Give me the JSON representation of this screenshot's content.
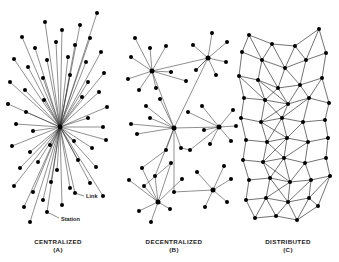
{
  "figure": {
    "background_color": "#ffffff",
    "node_color": "#000000",
    "edge_color": "#333333",
    "width": 339,
    "height": 262
  },
  "annotations": {
    "link_label": "Link",
    "station_label": "Station",
    "link_label_pos": {
      "x": 86,
      "y": 198
    },
    "link_leader": {
      "x1": 84,
      "y1": 196,
      "x2": 75,
      "y2": 193
    },
    "station_label_pos": {
      "x": 61,
      "y": 221
    },
    "station_leader": {
      "x1": 59,
      "y1": 218,
      "x2": 47,
      "y2": 212
    }
  },
  "panels": [
    {
      "id": "centralized",
      "name": "CENTRALIZED",
      "letter": "(A)",
      "caption_x": 58,
      "caption_y": 244,
      "letter_y": 252,
      "type": "star",
      "hub": {
        "x": 60,
        "y": 127
      },
      "nodes": [
        {
          "x": 60,
          "y": 127
        },
        {
          "x": 22,
          "y": 37
        },
        {
          "x": 45,
          "y": 22
        },
        {
          "x": 62,
          "y": 30
        },
        {
          "x": 80,
          "y": 25
        },
        {
          "x": 97,
          "y": 13
        },
        {
          "x": 35,
          "y": 48
        },
        {
          "x": 56,
          "y": 42
        },
        {
          "x": 75,
          "y": 45
        },
        {
          "x": 90,
          "y": 38
        },
        {
          "x": 14,
          "y": 59
        },
        {
          "x": 28,
          "y": 67
        },
        {
          "x": 47,
          "y": 60
        },
        {
          "x": 68,
          "y": 57
        },
        {
          "x": 86,
          "y": 62
        },
        {
          "x": 101,
          "y": 52
        },
        {
          "x": 10,
          "y": 82
        },
        {
          "x": 25,
          "y": 90
        },
        {
          "x": 43,
          "y": 78
        },
        {
          "x": 70,
          "y": 75
        },
        {
          "x": 88,
          "y": 82
        },
        {
          "x": 104,
          "y": 73
        },
        {
          "x": 8,
          "y": 104
        },
        {
          "x": 26,
          "y": 112
        },
        {
          "x": 44,
          "y": 100
        },
        {
          "x": 82,
          "y": 97
        },
        {
          "x": 99,
          "y": 92
        },
        {
          "x": 107,
          "y": 107
        },
        {
          "x": 16,
          "y": 124
        },
        {
          "x": 33,
          "y": 131
        },
        {
          "x": 88,
          "y": 118
        },
        {
          "x": 103,
          "y": 127
        },
        {
          "x": 12,
          "y": 146
        },
        {
          "x": 30,
          "y": 152
        },
        {
          "x": 50,
          "y": 145
        },
        {
          "x": 74,
          "y": 141
        },
        {
          "x": 92,
          "y": 148
        },
        {
          "x": 106,
          "y": 140
        },
        {
          "x": 20,
          "y": 168
        },
        {
          "x": 38,
          "y": 162
        },
        {
          "x": 57,
          "y": 170
        },
        {
          "x": 78,
          "y": 160
        },
        {
          "x": 96,
          "y": 167
        },
        {
          "x": 14,
          "y": 186
        },
        {
          "x": 33,
          "y": 192
        },
        {
          "x": 51,
          "y": 182
        },
        {
          "x": 70,
          "y": 188
        },
        {
          "x": 90,
          "y": 183
        },
        {
          "x": 24,
          "y": 207
        },
        {
          "x": 43,
          "y": 200
        },
        {
          "x": 62,
          "y": 205
        },
        {
          "x": 47,
          "y": 212
        },
        {
          "x": 75,
          "y": 193
        },
        {
          "x": 103,
          "y": 196
        },
        {
          "x": 30,
          "y": 222
        }
      ]
    },
    {
      "id": "decentralized",
      "name": "DECENTRALIZED",
      "letter": "(B)",
      "caption_x": 174,
      "caption_y": 244,
      "letter_y": 252,
      "type": "multi-hub",
      "hubs": [
        {
          "x": 152,
          "y": 71
        },
        {
          "x": 208,
          "y": 58
        },
        {
          "x": 174,
          "y": 128
        },
        {
          "x": 219,
          "y": 127
        },
        {
          "x": 158,
          "y": 202
        },
        {
          "x": 213,
          "y": 190
        }
      ],
      "nodes": [
        {
          "x": 152,
          "y": 71
        },
        {
          "x": 208,
          "y": 58
        },
        {
          "x": 174,
          "y": 128
        },
        {
          "x": 219,
          "y": 127
        },
        {
          "x": 158,
          "y": 202
        },
        {
          "x": 213,
          "y": 190
        },
        {
          "x": 135,
          "y": 38
        },
        {
          "x": 150,
          "y": 48
        },
        {
          "x": 166,
          "y": 46
        },
        {
          "x": 131,
          "y": 57
        },
        {
          "x": 128,
          "y": 79
        },
        {
          "x": 139,
          "y": 90
        },
        {
          "x": 156,
          "y": 88
        },
        {
          "x": 171,
          "y": 72
        },
        {
          "x": 186,
          "y": 81
        },
        {
          "x": 193,
          "y": 45
        },
        {
          "x": 212,
          "y": 33
        },
        {
          "x": 227,
          "y": 42
        },
        {
          "x": 226,
          "y": 62
        },
        {
          "x": 216,
          "y": 75
        },
        {
          "x": 196,
          "y": 70
        },
        {
          "x": 146,
          "y": 106
        },
        {
          "x": 160,
          "y": 99
        },
        {
          "x": 150,
          "y": 118
        },
        {
          "x": 131,
          "y": 124
        },
        {
          "x": 137,
          "y": 134
        },
        {
          "x": 166,
          "y": 150
        },
        {
          "x": 181,
          "y": 148
        },
        {
          "x": 188,
          "y": 112
        },
        {
          "x": 202,
          "y": 106
        },
        {
          "x": 233,
          "y": 110
        },
        {
          "x": 236,
          "y": 126
        },
        {
          "x": 231,
          "y": 141
        },
        {
          "x": 210,
          "y": 144
        },
        {
          "x": 204,
          "y": 130
        },
        {
          "x": 142,
          "y": 168
        },
        {
          "x": 155,
          "y": 176
        },
        {
          "x": 171,
          "y": 163
        },
        {
          "x": 129,
          "y": 180
        },
        {
          "x": 182,
          "y": 179
        },
        {
          "x": 144,
          "y": 186
        },
        {
          "x": 139,
          "y": 211
        },
        {
          "x": 170,
          "y": 209
        },
        {
          "x": 151,
          "y": 222
        },
        {
          "x": 174,
          "y": 192
        },
        {
          "x": 197,
          "y": 172
        },
        {
          "x": 224,
          "y": 166
        },
        {
          "x": 231,
          "y": 179
        },
        {
          "x": 205,
          "y": 207
        },
        {
          "x": 227,
          "y": 202
        },
        {
          "x": 190,
          "y": 150
        }
      ],
      "edges": [
        [
          0,
          6
        ],
        [
          0,
          7
        ],
        [
          0,
          8
        ],
        [
          0,
          9
        ],
        [
          0,
          10
        ],
        [
          0,
          11
        ],
        [
          0,
          12
        ],
        [
          0,
          13
        ],
        [
          0,
          14
        ],
        [
          1,
          15
        ],
        [
          1,
          16
        ],
        [
          1,
          17
        ],
        [
          1,
          18
        ],
        [
          1,
          19
        ],
        [
          1,
          20
        ],
        [
          1,
          0
        ],
        [
          2,
          21
        ],
        [
          2,
          22
        ],
        [
          2,
          23
        ],
        [
          2,
          24
        ],
        [
          2,
          25
        ],
        [
          2,
          26
        ],
        [
          2,
          27
        ],
        [
          2,
          0
        ],
        [
          2,
          1
        ],
        [
          3,
          28
        ],
        [
          3,
          29
        ],
        [
          3,
          30
        ],
        [
          3,
          31
        ],
        [
          3,
          32
        ],
        [
          3,
          33
        ],
        [
          3,
          34
        ],
        [
          3,
          2
        ],
        [
          4,
          35
        ],
        [
          4,
          36
        ],
        [
          4,
          37
        ],
        [
          4,
          38
        ],
        [
          4,
          39
        ],
        [
          4,
          40
        ],
        [
          4,
          41
        ],
        [
          4,
          42
        ],
        [
          4,
          43
        ],
        [
          5,
          45
        ],
        [
          5,
          46
        ],
        [
          5,
          47
        ],
        [
          5,
          48
        ],
        [
          5,
          49
        ],
        [
          5,
          44
        ],
        [
          2,
          44
        ],
        [
          2,
          36
        ],
        [
          26,
          35
        ],
        [
          27,
          50
        ],
        [
          3,
          50
        ],
        [
          1,
          20
        ],
        [
          37,
          40
        ]
      ]
    },
    {
      "id": "distributed",
      "name": "DISTRIBUTED",
      "letter": "(C)",
      "caption_x": 288,
      "caption_y": 244,
      "letter_y": 252,
      "type": "mesh",
      "nodes": [
        {
          "x": 249,
          "y": 35
        },
        {
          "x": 272,
          "y": 44
        },
        {
          "x": 295,
          "y": 46
        },
        {
          "x": 319,
          "y": 29
        },
        {
          "x": 242,
          "y": 52
        },
        {
          "x": 262,
          "y": 60
        },
        {
          "x": 285,
          "y": 68
        },
        {
          "x": 306,
          "y": 60
        },
        {
          "x": 326,
          "y": 53
        },
        {
          "x": 239,
          "y": 76
        },
        {
          "x": 258,
          "y": 80
        },
        {
          "x": 278,
          "y": 88
        },
        {
          "x": 300,
          "y": 85
        },
        {
          "x": 322,
          "y": 78
        },
        {
          "x": 244,
          "y": 98
        },
        {
          "x": 265,
          "y": 100
        },
        {
          "x": 288,
          "y": 104
        },
        {
          "x": 309,
          "y": 98
        },
        {
          "x": 329,
          "y": 103
        },
        {
          "x": 241,
          "y": 118
        },
        {
          "x": 261,
          "y": 122
        },
        {
          "x": 282,
          "y": 118
        },
        {
          "x": 303,
          "y": 122
        },
        {
          "x": 325,
          "y": 120
        },
        {
          "x": 246,
          "y": 140
        },
        {
          "x": 267,
          "y": 142
        },
        {
          "x": 287,
          "y": 138
        },
        {
          "x": 308,
          "y": 142
        },
        {
          "x": 328,
          "y": 138
        },
        {
          "x": 243,
          "y": 160
        },
        {
          "x": 263,
          "y": 162
        },
        {
          "x": 284,
          "y": 158
        },
        {
          "x": 305,
          "y": 163
        },
        {
          "x": 326,
          "y": 158
        },
        {
          "x": 249,
          "y": 180
        },
        {
          "x": 270,
          "y": 178
        },
        {
          "x": 290,
          "y": 182
        },
        {
          "x": 311,
          "y": 180
        },
        {
          "x": 330,
          "y": 176
        },
        {
          "x": 246,
          "y": 200
        },
        {
          "x": 266,
          "y": 198
        },
        {
          "x": 288,
          "y": 202
        },
        {
          "x": 309,
          "y": 198
        },
        {
          "x": 255,
          "y": 218
        },
        {
          "x": 276,
          "y": 216
        },
        {
          "x": 297,
          "y": 220
        },
        {
          "x": 318,
          "y": 206
        }
      ],
      "edges": [
        [
          0,
          1
        ],
        [
          1,
          2
        ],
        [
          2,
          3
        ],
        [
          0,
          4
        ],
        [
          0,
          5
        ],
        [
          1,
          5
        ],
        [
          1,
          6
        ],
        [
          2,
          6
        ],
        [
          2,
          7
        ],
        [
          3,
          7
        ],
        [
          3,
          8
        ],
        [
          4,
          5
        ],
        [
          5,
          6
        ],
        [
          6,
          7
        ],
        [
          7,
          8
        ],
        [
          4,
          9
        ],
        [
          5,
          10
        ],
        [
          6,
          11
        ],
        [
          7,
          12
        ],
        [
          8,
          13
        ],
        [
          9,
          10
        ],
        [
          10,
          11
        ],
        [
          11,
          12
        ],
        [
          12,
          13
        ],
        [
          9,
          14
        ],
        [
          10,
          15
        ],
        [
          11,
          16
        ],
        [
          12,
          17
        ],
        [
          13,
          18
        ],
        [
          14,
          15
        ],
        [
          15,
          16
        ],
        [
          16,
          17
        ],
        [
          17,
          18
        ],
        [
          14,
          19
        ],
        [
          15,
          20
        ],
        [
          16,
          21
        ],
        [
          17,
          22
        ],
        [
          18,
          23
        ],
        [
          19,
          20
        ],
        [
          20,
          21
        ],
        [
          21,
          22
        ],
        [
          22,
          23
        ],
        [
          19,
          24
        ],
        [
          20,
          25
        ],
        [
          21,
          26
        ],
        [
          22,
          27
        ],
        [
          23,
          28
        ],
        [
          24,
          25
        ],
        [
          25,
          26
        ],
        [
          26,
          27
        ],
        [
          27,
          28
        ],
        [
          24,
          29
        ],
        [
          25,
          30
        ],
        [
          26,
          31
        ],
        [
          27,
          32
        ],
        [
          28,
          33
        ],
        [
          29,
          30
        ],
        [
          30,
          31
        ],
        [
          31,
          32
        ],
        [
          32,
          33
        ],
        [
          29,
          34
        ],
        [
          30,
          35
        ],
        [
          31,
          36
        ],
        [
          32,
          37
        ],
        [
          33,
          38
        ],
        [
          34,
          35
        ],
        [
          35,
          36
        ],
        [
          36,
          37
        ],
        [
          37,
          38
        ],
        [
          34,
          39
        ],
        [
          35,
          40
        ],
        [
          36,
          41
        ],
        [
          37,
          42
        ],
        [
          38,
          42
        ],
        [
          39,
          40
        ],
        [
          40,
          41
        ],
        [
          41,
          42
        ],
        [
          39,
          43
        ],
        [
          40,
          43
        ],
        [
          41,
          44
        ],
        [
          41,
          45
        ],
        [
          42,
          46
        ],
        [
          43,
          44
        ],
        [
          44,
          45
        ],
        [
          45,
          46
        ],
        [
          38,
          46
        ],
        [
          5,
          11
        ],
        [
          6,
          12
        ],
        [
          10,
          16
        ],
        [
          15,
          21
        ],
        [
          20,
          26
        ],
        [
          25,
          31
        ],
        [
          30,
          36
        ],
        [
          35,
          41
        ],
        [
          11,
          15
        ],
        [
          16,
          20
        ],
        [
          21,
          25
        ],
        [
          26,
          30
        ],
        [
          31,
          35
        ],
        [
          36,
          40
        ],
        [
          12,
          16
        ],
        [
          17,
          21
        ],
        [
          22,
          26
        ],
        [
          27,
          31
        ],
        [
          32,
          36
        ],
        [
          37,
          41
        ],
        [
          45,
          42
        ],
        [
          44,
          40
        ],
        [
          9,
          15
        ],
        [
          13,
          17
        ]
      ]
    }
  ]
}
